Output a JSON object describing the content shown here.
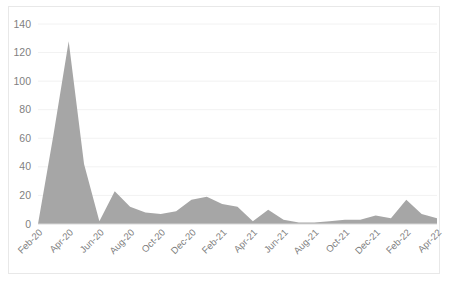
{
  "chart": {
    "title": "",
    "background_color": "#ffffff",
    "border_color": "#e8e8e8",
    "series_color": "#a6a6a6",
    "gridline_color": "#f2f2f2",
    "axis_color": "#d9d9d9",
    "tick_text_color": "#7f7f7f"
  },
  "chart_data": {
    "type": "area",
    "title": "",
    "xlabel": "",
    "ylabel": "",
    "ylim": [
      0,
      140
    ],
    "ytick_step": 20,
    "grid": true,
    "legend": false,
    "x_tick_step_months": 2,
    "y_ticks": [
      "0",
      "20",
      "40",
      "60",
      "80",
      "100",
      "120",
      "140"
    ],
    "x_ticks": [
      "Feb-20",
      "Apr-20",
      "Jun-20",
      "Aug-20",
      "Oct-20",
      "Dec-20",
      "Feb-21",
      "Apr-21",
      "Jun-21",
      "Aug-21",
      "Oct-21",
      "Dec-21",
      "Feb-22",
      "Apr-22"
    ],
    "categories": [
      "Feb-20",
      "Mar-20",
      "Apr-20",
      "May-20",
      "Jun-20",
      "Jul-20",
      "Aug-20",
      "Sep-20",
      "Oct-20",
      "Nov-20",
      "Dec-20",
      "Jan-21",
      "Feb-21",
      "Mar-21",
      "Apr-21",
      "May-21",
      "Jun-21",
      "Jul-21",
      "Aug-21",
      "Sep-21",
      "Oct-21",
      "Nov-21",
      "Dec-21",
      "Jan-22",
      "Feb-22",
      "Mar-22",
      "Apr-22"
    ],
    "values": [
      0,
      62,
      128,
      42,
      2,
      23,
      12,
      8,
      7,
      9,
      17,
      19,
      14,
      12,
      2,
      10,
      3,
      1,
      1,
      2,
      3,
      3,
      6,
      4,
      17,
      7,
      4
    ],
    "series": [
      {
        "name": "Series 1",
        "color": "#a6a6a6",
        "values": [
          0,
          62,
          128,
          42,
          2,
          23,
          12,
          8,
          7,
          9,
          17,
          19,
          14,
          12,
          2,
          10,
          3,
          1,
          1,
          2,
          3,
          3,
          6,
          4,
          17,
          7,
          4
        ]
      }
    ]
  }
}
